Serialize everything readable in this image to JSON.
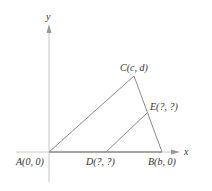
{
  "diagram": {
    "axes": {
      "x_label": "x",
      "y_label": "y"
    },
    "points": {
      "A": {
        "label": "A(0, 0)",
        "coords": "(0, 0)"
      },
      "B": {
        "label": "B(b, 0)",
        "coords": "(b, 0)"
      },
      "C": {
        "label": "C(c, d)",
        "coords": "(c, d)"
      },
      "D": {
        "label": "D(?, ?)",
        "coords": "(?, ?)"
      },
      "E": {
        "label": "E(?, ?)",
        "coords": "(?, ?)"
      }
    },
    "segments": [
      "AB",
      "AC",
      "CB",
      "DE"
    ],
    "colors": {
      "axis": "#c8c8c8",
      "triangle": "#8a8a8a",
      "base": "#666666",
      "text": "#333333"
    }
  }
}
